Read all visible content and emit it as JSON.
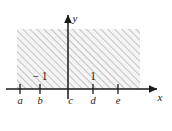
{
  "figure": {
    "kind": "cartesian-plane-shaded-region",
    "background_color": "#ffffff",
    "axis_color": "#1a1a1a",
    "hatch_color": "#8c8c8c",
    "region_fill_color": "#f2f2f2",
    "axes": {
      "x_axis_label": "x",
      "y_axis_label": "y",
      "x_axis_y_px": 89,
      "y_axis_x_px": 68
    },
    "x_ticks": [
      {
        "id": "a",
        "label": "a",
        "x_px": 20,
        "value_label": ""
      },
      {
        "id": "b",
        "label": "b",
        "x_px": 40,
        "value_label": "− 1"
      },
      {
        "id": "c",
        "label": "c",
        "x_px": 68,
        "value_label": ""
      },
      {
        "id": "d",
        "label": "d",
        "x_px": 93,
        "value_label": "1"
      },
      {
        "id": "e",
        "label": "e",
        "x_px": 118,
        "value_label": ""
      }
    ],
    "shaded_region": {
      "left_px": 17,
      "right_px": 140,
      "top_px": 29,
      "bottom_px": 89,
      "hatch_direction": "lower-left-to-upper-right",
      "description": "hatched band above the x-axis"
    }
  }
}
